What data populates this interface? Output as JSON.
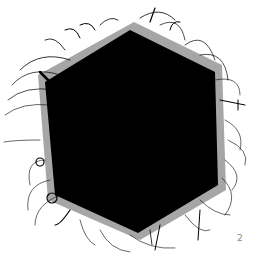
{
  "artwork": {
    "shape": "hexagon-blob-with-hairs",
    "fill_color": "#000000",
    "background_color": "#ffffff"
  },
  "page_number": "2"
}
